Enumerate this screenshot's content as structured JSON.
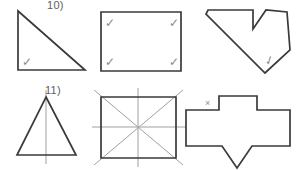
{
  "page": {
    "kind": "geometry-worksheet",
    "width": 298,
    "height": 170,
    "background_color": "#ffffff",
    "stroke_color": "#3a3a3a",
    "mark_color": "#8c8c8c",
    "symmetry_line_color": "#a0a0a0"
  },
  "labels": {
    "item_10": "10)",
    "item_11": "11)"
  },
  "marks": {
    "check_glyph": "✓",
    "x_glyph": "×"
  },
  "shapes": [
    {
      "id": "right-triangle",
      "name": "right-triangle",
      "row": 1,
      "column": 1,
      "points": "18,11 18,70 85,70",
      "marks": [
        {
          "type": "check",
          "x": 22,
          "y": 57,
          "rotation": 0
        }
      ]
    },
    {
      "id": "rectangle",
      "name": "rectangle",
      "row": 1,
      "column": 2,
      "points": "101,12 181,12 181,71 101,71",
      "marks": [
        {
          "type": "check",
          "x": 105,
          "y": 18,
          "rotation": 0
        },
        {
          "type": "check",
          "x": 169,
          "y": 18,
          "rotation": 0
        },
        {
          "type": "check",
          "x": 105,
          "y": 57,
          "rotation": 0
        },
        {
          "type": "check",
          "x": 169,
          "y": 57,
          "rotation": 0
        }
      ]
    },
    {
      "id": "concave-arrow-polygon",
      "name": "concave-arrow-polygon",
      "row": 1,
      "column": 3,
      "points": "208,10 253,10 253,29 266,10 287,12 290,50 265,73 206,14",
      "marks": [
        {
          "type": "check",
          "x": 266,
          "y": 57,
          "rotation": -20
        }
      ]
    },
    {
      "id": "isosceles-triangle",
      "name": "isosceles-triangle",
      "row": 2,
      "column": 1,
      "points": "46,97 76,155 17,155",
      "symmetry_lines": [
        {
          "x1": 46,
          "y1": 90,
          "x2": 46,
          "y2": 164
        }
      ],
      "marks": []
    },
    {
      "id": "square-with-symmetry-lines",
      "name": "square-with-symmetry-lines",
      "row": 2,
      "column": 2,
      "points": "101,97 176,97 176,158 101,158",
      "symmetry_lines": [
        {
          "x1": 94,
          "y1": 90,
          "x2": 183,
          "y2": 165
        },
        {
          "x1": 183,
          "y1": 90,
          "x2": 94,
          "y2": 165
        },
        {
          "x1": 92,
          "y1": 127,
          "x2": 186,
          "y2": 127
        },
        {
          "x1": 138,
          "y1": 88,
          "x2": 138,
          "y2": 167
        }
      ],
      "marks": []
    },
    {
      "id": "cross-arrow-polygon",
      "name": "cross-arrow-polygon",
      "row": 2,
      "column": 3,
      "points": "186,110 219,110 219,96 257,96 257,110 290,110 290,146 252,146 237,168 222,146 186,146",
      "marks": [
        {
          "type": "x",
          "x": 205,
          "y": 97,
          "rotation": 0
        }
      ]
    }
  ]
}
